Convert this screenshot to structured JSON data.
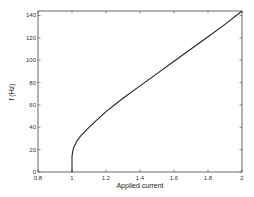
{
  "chart_data": {
    "type": "line",
    "title": "",
    "xlabel": "Applied current",
    "ylabel": "f (Hz)",
    "xlim": [
      0.8,
      2.0
    ],
    "ylim": [
      0,
      144
    ],
    "xticks": [
      0.8,
      1.0,
      1.2,
      1.4,
      1.6,
      1.8,
      2.0
    ],
    "xtick_labels": [
      "0.8",
      "1",
      "1.2",
      "1.4",
      "1.6",
      "1.8",
      "2"
    ],
    "yticks": [
      0,
      20,
      40,
      60,
      80,
      100,
      120,
      140
    ],
    "ytick_labels": [
      "0",
      "20",
      "40",
      "60",
      "80",
      "100",
      "120",
      "140"
    ],
    "grid": false,
    "legend": null,
    "series": [
      {
        "name": "f",
        "color": "#222222",
        "x": [
          1.0,
          1.0,
          1.005,
          1.01,
          1.03,
          1.05,
          1.1,
          1.15,
          1.2,
          1.3,
          1.4,
          1.5,
          1.6,
          1.7,
          1.8,
          1.9,
          2.0
        ],
        "y": [
          0,
          14,
          19,
          22,
          28,
          32,
          40,
          47,
          54,
          66,
          77,
          88,
          99,
          110,
          121,
          132,
          144
        ]
      }
    ]
  }
}
